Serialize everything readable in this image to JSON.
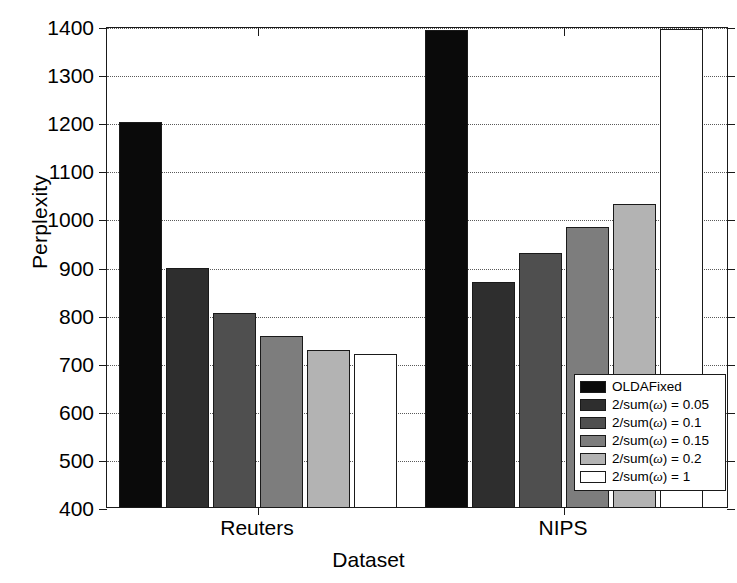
{
  "chart_data": {
    "type": "bar",
    "title": "",
    "xlabel": "Dataset",
    "ylabel": "Perplexity",
    "categories": [
      "Reuters",
      "NIPS"
    ],
    "ylim": [
      400,
      1400
    ],
    "yticks": [
      400,
      500,
      600,
      700,
      800,
      900,
      1000,
      1100,
      1200,
      1300,
      1400
    ],
    "ytick_labels": [
      "400",
      "500",
      "600",
      "700",
      "800",
      "900",
      "1000",
      "1100",
      "1200",
      "1300",
      "1400"
    ],
    "grid": true,
    "legend_position": "lower right",
    "series": [
      {
        "name": "OLDAFixed",
        "color": "#0a0a0a",
        "values": [
          1205,
          1395
        ]
      },
      {
        "name": "2/sum(ω) = 0.05",
        "color": "#2e2e2e",
        "values": [
          902,
          872
        ]
      },
      {
        "name": "2/sum(ω) = 0.1",
        "color": "#4f4f4f",
        "values": [
          808,
          932
        ]
      },
      {
        "name": "2/sum(ω) = 0.15",
        "color": "#7d7d7d",
        "values": [
          760,
          987
        ]
      },
      {
        "name": "2/sum(ω) = 0.2",
        "color": "#b3b3b3",
        "values": [
          730,
          1035
        ]
      },
      {
        "name": "2/sum(ω) = 1",
        "color": "#ffffff",
        "values": [
          722,
          1398
        ]
      }
    ]
  },
  "legend": {
    "items": [
      {
        "label": "OLDAFixed",
        "color": "#0a0a0a"
      },
      {
        "label": "2/sum(ω) = 0.05",
        "color": "#2e2e2e"
      },
      {
        "label": "2/sum(ω) = 0.1",
        "color": "#4f4f4f"
      },
      {
        "label": "2/sum(ω) = 0.15",
        "color": "#7d7d7d"
      },
      {
        "label": "2/sum(ω) = 0.2",
        "color": "#b3b3b3"
      },
      {
        "label": "2/sum(ω) = 1",
        "color": "#ffffff"
      }
    ]
  },
  "axis": {
    "y_title": "Perplexity",
    "x_title": "Dataset"
  }
}
